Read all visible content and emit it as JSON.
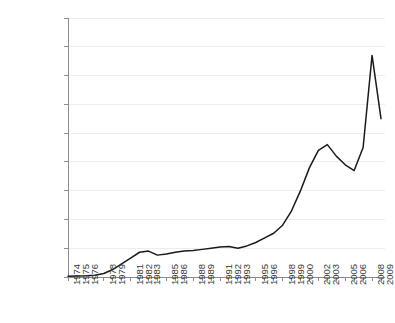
{
  "chart_data": {
    "type": "line",
    "title": "",
    "subtitle": "",
    "xlabel": "",
    "ylabel": "",
    "grid": true,
    "legend": null,
    "legend_position": "none",
    "line_color": "#1a1a1a",
    "axis_color": "#8c8c8c",
    "grid_color": "#ededed",
    "text_color": "#3a3a3a",
    "background": "#ffffff",
    "ylim": [
      0,
      4500000
    ],
    "xlim": [
      1974,
      2009
    ],
    "ytick_values": [
      0,
      500000,
      1000000,
      1500000,
      2000000,
      2500000,
      3000000,
      3500000,
      4000000,
      4500000
    ],
    "ytick_labels": [
      "0",
      "500,000",
      "1,000,000",
      "1,500,000",
      "2,000,000",
      "2,500,000",
      "3,000,000",
      "3,500,000",
      "4,000,000",
      "4,500,000"
    ],
    "xtick_labels": [
      "1974",
      "1975",
      "1976",
      "1978",
      "1979",
      "1981",
      "1982",
      "1983",
      "1985",
      "1986",
      "1988",
      "1989",
      "1991",
      "1992",
      "1993",
      "1995",
      "1996",
      "1998",
      "1999",
      "2000",
      "2002",
      "2003",
      "2005",
      "2006",
      "2008",
      "2009"
    ],
    "x": [
      1974,
      1975,
      1976,
      1977,
      1978,
      1979,
      1980,
      1981,
      1982,
      1983,
      1984,
      1985,
      1986,
      1987,
      1988,
      1989,
      1990,
      1991,
      1992,
      1993,
      1994,
      1995,
      1996,
      1997,
      1998,
      1999,
      2000,
      2001,
      2002,
      2003,
      2004,
      2005,
      2006,
      2007,
      2008,
      2009
    ],
    "values": [
      15000,
      18000,
      22000,
      30000,
      60000,
      130000,
      230000,
      330000,
      430000,
      450000,
      380000,
      400000,
      430000,
      450000,
      460000,
      480000,
      500000,
      520000,
      530000,
      500000,
      540000,
      600000,
      680000,
      760000,
      900000,
      1150000,
      1500000,
      1900000,
      2200000,
      2300000,
      2100000,
      1950000,
      1850000,
      2250000,
      3850000,
      2750000
    ],
    "series": [
      {
        "name": "series-1",
        "values": [
          15000,
          18000,
          22000,
          30000,
          60000,
          130000,
          230000,
          330000,
          430000,
          450000,
          380000,
          400000,
          430000,
          450000,
          460000,
          480000,
          500000,
          520000,
          530000,
          500000,
          540000,
          600000,
          680000,
          760000,
          900000,
          1150000,
          1500000,
          1900000,
          2200000,
          2300000,
          2100000,
          1950000,
          1850000,
          2250000,
          3850000,
          2750000
        ]
      }
    ]
  },
  "layout": {
    "plot_left": 68,
    "plot_right": 381,
    "plot_top": 18,
    "plot_bottom": 277
  }
}
